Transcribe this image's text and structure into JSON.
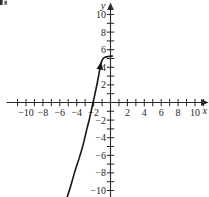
{
  "page": {
    "background": "#ffffff",
    "corner_artifact": "cut-off glyph fragment at top-left corner"
  },
  "colors": {
    "axis": "#2d2d2d",
    "curve": "#161616",
    "label": "#1f1f1f"
  },
  "chart_data": {
    "type": "line",
    "title": "",
    "xlabel": "x",
    "ylabel": "y",
    "xlim": [
      -11.8,
      11.6
    ],
    "ylim": [
      -10.8,
      11.4
    ],
    "grid": false,
    "axes_style": "origin-centered cross axes with arrowheads on +x (right) and +y (top)",
    "x_tick_step": 1,
    "y_tick_step": 1,
    "x_tick_positions": [
      -11,
      -10,
      -9,
      -8,
      -7,
      -6,
      -5,
      -4,
      -3,
      -2,
      -1,
      1,
      2,
      3,
      4,
      5,
      6,
      7,
      8,
      9,
      10,
      11
    ],
    "y_tick_positions": [
      -10,
      -9,
      -8,
      -7,
      -6,
      -5,
      -4,
      -3,
      -2,
      -1,
      1,
      2,
      3,
      4,
      5,
      6,
      7,
      8,
      9,
      10
    ],
    "x_tick_labels": [
      {
        "v": -10,
        "t": "−10"
      },
      {
        "v": -8,
        "t": "−8"
      },
      {
        "v": -6,
        "t": "−6"
      },
      {
        "v": -4,
        "t": "−4"
      },
      {
        "v": -2,
        "t": "−2"
      },
      {
        "v": 2,
        "t": "2"
      },
      {
        "v": 4,
        "t": "4"
      },
      {
        "v": 6,
        "t": "6"
      },
      {
        "v": 8,
        "t": "8"
      },
      {
        "v": 10,
        "t": "10"
      }
    ],
    "y_tick_labels": [
      {
        "v": 10,
        "t": "10"
      },
      {
        "v": 8,
        "t": "8"
      },
      {
        "v": 6,
        "t": "6"
      },
      {
        "v": 4,
        "t": "4"
      },
      {
        "v": 2,
        "t": "2"
      },
      {
        "v": -2,
        "t": "−2"
      },
      {
        "v": -4,
        "t": "−4"
      },
      {
        "v": -6,
        "t": "−6"
      },
      {
        "v": -8,
        "t": "−8"
      },
      {
        "v": -10,
        "t": "−10"
      }
    ],
    "series": [
      {
        "name": "curve",
        "color": "#161616",
        "x_intercept": -2,
        "flattens_toward_y": 5.3,
        "direction_arrow_at": [
          -1.22,
          4.03
        ],
        "points": [
          [
            -5.12,
            -10.74
          ],
          [
            -4.71,
            -9.49
          ],
          [
            -4.24,
            -7.9
          ],
          [
            -3.78,
            -6.53
          ],
          [
            -3.31,
            -5.06
          ],
          [
            -2.85,
            -3.24
          ],
          [
            -2.5,
            -1.88
          ],
          [
            -2.15,
            -0.4
          ],
          [
            -1.92,
            0.63
          ],
          [
            -1.69,
            1.65
          ],
          [
            -1.45,
            2.78
          ],
          [
            -1.22,
            4.03
          ],
          [
            -1.05,
            4.66
          ],
          [
            -0.87,
            5.0
          ],
          [
            -0.64,
            5.15
          ],
          [
            -0.35,
            5.22
          ],
          [
            -0.06,
            5.26
          ],
          [
            0.23,
            5.28
          ]
        ]
      }
    ]
  }
}
